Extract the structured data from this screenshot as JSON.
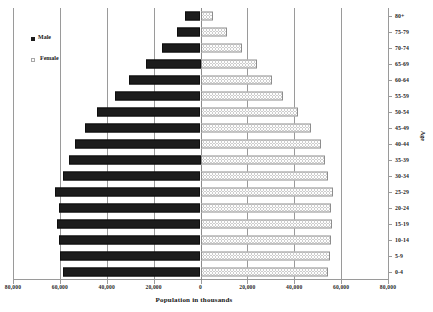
{
  "chart_data": {
    "type": "bar",
    "subtype": "population-pyramid",
    "title": "",
    "xlabel": "Population in thousands",
    "ylabel": "Age",
    "categories": [
      "0-4",
      "5-9",
      "10-14",
      "15-19",
      "20-24",
      "25-29",
      "30-34",
      "35-39",
      "40-44",
      "45-49",
      "50-54",
      "55-59",
      "60-64",
      "65-69",
      "70-74",
      "75-79",
      "80+"
    ],
    "series": [
      {
        "name": "Male",
        "color": "#1c1c1c",
        "side": "left",
        "values": [
          58800,
          59900,
          60500,
          61300,
          60200,
          62000,
          58500,
          56000,
          53700,
          49200,
          44300,
          36600,
          30500,
          23200,
          16600,
          10200,
          6700
        ]
      },
      {
        "name": "Female",
        "color": "#fdfdfd",
        "side": "right",
        "values": [
          54500,
          55300,
          55800,
          56300,
          55600,
          56400,
          54600,
          53300,
          51400,
          47000,
          41800,
          35400,
          30300,
          24000,
          17600,
          11200,
          5400
        ]
      }
    ],
    "xlim": [
      -80000,
      80000
    ],
    "xticks": [
      -80000,
      -60000,
      -40000,
      -20000,
      0,
      20000,
      40000,
      60000,
      80000
    ],
    "xtick_labels": [
      "80,000",
      "60,000",
      "40,000",
      "20,000",
      "0",
      "20,000",
      "40,000",
      "60,000",
      "80,000"
    ],
    "grid": true,
    "grid_axis": "x",
    "legend_position": "upper-left",
    "legend": [
      "Male",
      "Female"
    ]
  },
  "axes": {
    "x_title": "Population in thousands",
    "y_title": "Age"
  },
  "legend": {
    "male_label": "Male",
    "female_label": "Female"
  }
}
